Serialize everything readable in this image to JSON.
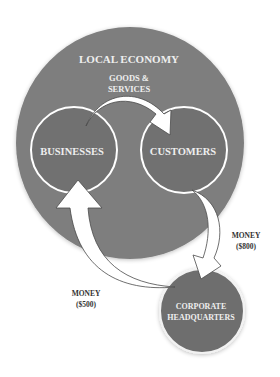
{
  "diagram": {
    "title": "LOCAL ECONOMY",
    "nodes": {
      "local_economy": {
        "label": "LOCAL ECONOMY"
      },
      "businesses": {
        "label": "BUSINESSES"
      },
      "customers": {
        "label": "CUSTOMERS"
      },
      "headquarters": {
        "line1": "CORPORATE",
        "line2": "HEADQUARTERS"
      }
    },
    "flows": {
      "goods": {
        "line1": "GOODS &",
        "line2": "SERVICES",
        "from": "BUSINESSES",
        "to": "CUSTOMERS"
      },
      "money_out": {
        "line1": "MONEY",
        "line2": "($800)",
        "from": "CUSTOMERS",
        "to": "CORPORATE HEADQUARTERS"
      },
      "money_back": {
        "line1": "MONEY",
        "line2": "($500)",
        "from": "CORPORATE HEADQUARTERS",
        "to": "BUSINESSES"
      }
    },
    "colors": {
      "outer_circle": "#7e7e7e",
      "inner_circle": "#717171",
      "hq_circle": "#6e6e6e",
      "outline": "#ffffff",
      "arrow_fill": "#ffffff",
      "arrow_stroke": "#4a4a4a",
      "label_on_dark": "#eeeeee",
      "label_on_light": "#333333"
    }
  }
}
